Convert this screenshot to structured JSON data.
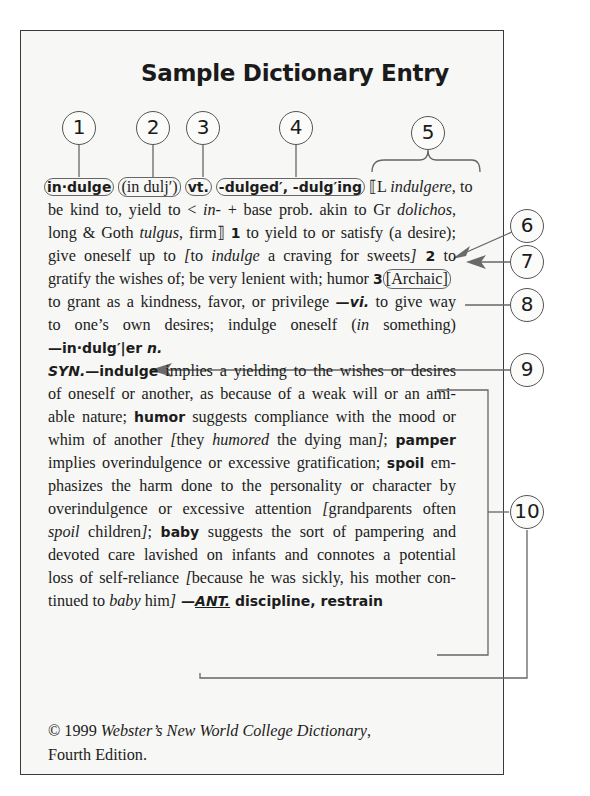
{
  "title": "Sample Dictionary Entry",
  "callouts": [
    "1",
    "2",
    "3",
    "4",
    "5",
    "6",
    "7",
    "8",
    "9",
    "10"
  ],
  "entry": {
    "headword": "in·dulge",
    "pronunciation": "(in dulj′)",
    "pos": "vt.",
    "inflections": "-dulged′, -dulg′ing",
    "etym_open": "⟦L ",
    "etym_word": "indulgere",
    "etym_rest": ", to",
    "l2a": "be kind to, yield to < ",
    "l2b": "in-",
    "l2c": " + base prob. akin to Gr ",
    "l2d": "dolichos",
    "l2e": ",",
    "l3a": "long & Goth ",
    "l3b": "tulgus",
    "l3c": ", firm⟧ ",
    "l3d": "1",
    "l3e": " to yield to or satisfy (a desire);",
    "l4a": "give oneself up to ",
    "l4b": "[",
    "l4c": "to ",
    "l4d": "indulge",
    "l4e": " a craving for sweets",
    "l4f": "]",
    "l4g": " 2",
    "l4h": " to",
    "l5a": "gratify the wishes of; be very lenient with; humor ",
    "l5b": "3",
    "l5c": "[Archaic]",
    "l6a": "to grant as a kindness, favor, or privilege ",
    "l6b": "—vi.",
    "l6c": " to give way",
    "l7a": "to one’s own desires; indulge oneself (",
    "l7b": "in",
    "l7c": " something)",
    "l8": "—in·dulg′|er ",
    "l8n": "n."
  },
  "synonymy": {
    "l1a": "SYN.",
    "l1b": "—indulge",
    "l1c": " implies a yielding to the wishes or desires",
    "l2": "of oneself or another, as because of a weak will or an ami-",
    "l3a": "able nature; ",
    "l3b": "humor",
    "l3c": " suggests compliance with the mood or",
    "l4a": "whim of another ",
    "l4b": "[",
    "l4c": "they ",
    "l4d": "humored",
    "l4e": " the dying man",
    "l4f": "]",
    "l4g": "; ",
    "l4h": "pamper",
    "l5a": "implies overindulgence or excessive gratification; ",
    "l5b": "spoil",
    "l5c": " em-",
    "l6": "phasizes the harm done to the personality or character by",
    "l7a": "overindulgence or excessive attention ",
    "l7b": "[",
    "l7c": "grandparents often",
    "l8a": "spoil",
    "l8b": " children",
    "l8c": "]",
    "l8d": "; ",
    "l8e": "baby",
    "l8f": " suggests the sort of pampering and",
    "l9": "devoted care lavished on infants and connotes a potential",
    "l10a": "loss of self-reliance ",
    "l10b": "[",
    "l10c": "because he was sickly, his mother con-",
    "l11a": "tinued to ",
    "l11b": "baby",
    "l11c": " him",
    "l11d": "]",
    "l11e": " —",
    "l11f": "ANT.",
    "l11g": " discipline, restrain"
  },
  "footer": {
    "copyright": "© 1999 ",
    "source": "Webster’s New World College Dictionary",
    "comma": ",",
    "edition": "Fourth Edition."
  }
}
